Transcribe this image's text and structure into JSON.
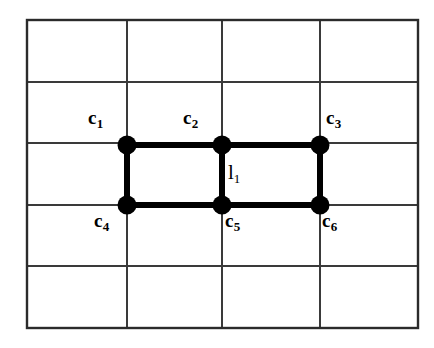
{
  "figure": {
    "background_color": "#ffffff",
    "grid": {
      "columns": 4,
      "rows": 5,
      "line_color": "#3a3a3a",
      "border_color": "#2b2b2b",
      "x_lines": [
        27,
        127,
        222,
        320,
        418
      ],
      "y_lines": [
        20,
        82,
        143,
        205,
        266,
        328
      ]
    },
    "graph": {
      "edge_color": "#000000",
      "node_color": "#000000",
      "node_radius": 9,
      "edge_width": 6,
      "nodes": [
        {
          "id": "c1",
          "base": "c",
          "sub": "1",
          "x": 127,
          "y": 145,
          "label_x": 88,
          "label_y": 108
        },
        {
          "id": "c2",
          "base": "c",
          "sub": "2",
          "x": 222,
          "y": 145,
          "label_x": 183,
          "label_y": 108
        },
        {
          "id": "c3",
          "base": "c",
          "sub": "3",
          "x": 320,
          "y": 145,
          "label_x": 326,
          "label_y": 108
        },
        {
          "id": "c4",
          "base": "c",
          "sub": "4",
          "x": 127,
          "y": 205,
          "label_x": 94,
          "label_y": 211
        },
        {
          "id": "c5",
          "base": "c",
          "sub": "5",
          "x": 222,
          "y": 205,
          "label_x": 225,
          "label_y": 211
        },
        {
          "id": "c6",
          "base": "c",
          "sub": "6",
          "x": 320,
          "y": 205,
          "label_x": 322,
          "label_y": 211
        }
      ],
      "edges": [
        {
          "id": "e-c1-c2",
          "from": "c1",
          "to": "c2"
        },
        {
          "id": "e-c2-c3",
          "from": "c2",
          "to": "c3"
        },
        {
          "id": "e-c1-c4",
          "from": "c1",
          "to": "c4"
        },
        {
          "id": "e-c2-c5",
          "from": "c2",
          "to": "c5"
        },
        {
          "id": "e-c3-c6",
          "from": "c3",
          "to": "c6"
        },
        {
          "id": "e-c4-c5",
          "from": "c4",
          "to": "c5"
        },
        {
          "id": "e-c5-c6",
          "from": "c5",
          "to": "c6"
        }
      ],
      "edge_labels": [
        {
          "id": "l1",
          "base": "l",
          "sub": "1",
          "x": 228,
          "y": 162
        }
      ]
    }
  }
}
